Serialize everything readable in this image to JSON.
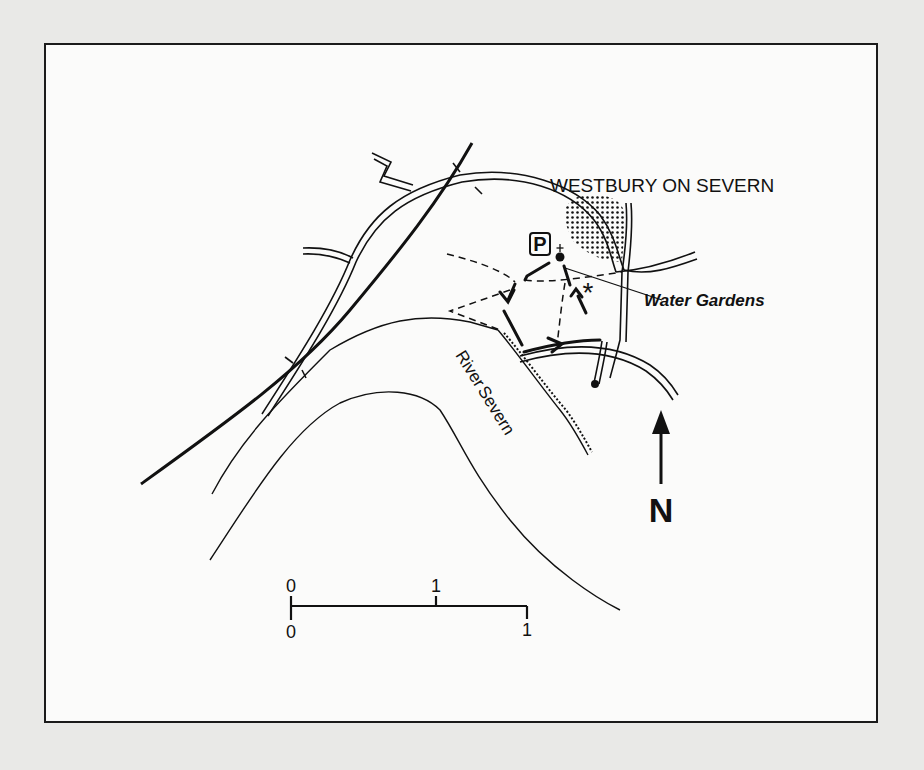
{
  "map": {
    "place_label": "WESTBURY ON SEVERN",
    "feature_label": "Water Gardens",
    "river_label_1": "River",
    "river_label_2": "Severn",
    "parking_symbol": "P",
    "north_label": "N",
    "viewpoint_symbol": "*",
    "scale": {
      "top_labels": [
        "0",
        "1"
      ],
      "bottom_labels": [
        "0",
        "1"
      ]
    },
    "legend_icons": [
      "parking-icon",
      "church-icon",
      "viewpoint-asterisk-icon",
      "north-arrow-icon"
    ],
    "colors": {
      "ink": "#111111",
      "paper": "#fbfbfa",
      "page": "#e9e9e7"
    }
  }
}
